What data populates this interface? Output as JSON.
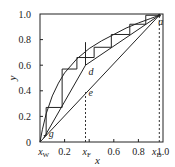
{
  "chart_data": {
    "type": "line",
    "title": "",
    "xlabel": "x",
    "ylabel": "y",
    "xlim": [
      0,
      1.0
    ],
    "ylim": [
      0,
      1.0
    ],
    "grid": false,
    "x_tick_labels": [
      {
        "value": 0.03,
        "label": "x",
        "sub": "W"
      },
      {
        "value": 0.2,
        "label": "0.2"
      },
      {
        "value": 0.38,
        "label": "x",
        "sub": "F"
      },
      {
        "value": 0.6,
        "label": "0.6"
      },
      {
        "value": 0.8,
        "label": "0.8"
      },
      {
        "value": 0.95,
        "label": "x",
        "sub": "D"
      },
      {
        "value": 1.0,
        "label": "1.0"
      }
    ],
    "y_tick_labels": [
      {
        "value": 0,
        "label": "0"
      },
      {
        "value": 0.2,
        "label": "0.2"
      },
      {
        "value": 0.4,
        "label": "0.4"
      },
      {
        "value": 0.6,
        "label": "0.6"
      },
      {
        "value": 0.8,
        "label": "0.8"
      },
      {
        "value": 1.0,
        "label": "1.0"
      }
    ],
    "x_ticks_minor": [
      0.2,
      0.4,
      0.6,
      0.8
    ],
    "y_ticks_minor": [
      0.2,
      0.4,
      0.6,
      0.8
    ],
    "series": [
      {
        "name": "equilibrium curve",
        "points": [
          [
            0,
            0
          ],
          [
            0.02,
            0.1
          ],
          [
            0.05,
            0.22
          ],
          [
            0.1,
            0.36
          ],
          [
            0.15,
            0.46
          ],
          [
            0.2,
            0.54
          ],
          [
            0.3,
            0.65
          ],
          [
            0.4,
            0.73
          ],
          [
            0.5,
            0.79
          ],
          [
            0.6,
            0.84
          ],
          [
            0.7,
            0.89
          ],
          [
            0.8,
            0.93
          ],
          [
            0.9,
            0.965
          ],
          [
            0.97,
            0.99
          ]
        ]
      },
      {
        "name": "diagonal",
        "points": [
          [
            0,
            0
          ],
          [
            0.97,
            0.99
          ]
        ]
      },
      {
        "name": "rectifying operating line",
        "points": [
          [
            0.97,
            0.99
          ],
          [
            0.37,
            0.6
          ]
        ]
      },
      {
        "name": "stripping operating line",
        "points": [
          [
            0.03,
            0.03
          ],
          [
            0.37,
            0.6
          ]
        ]
      },
      {
        "name": "q-line",
        "points": [
          [
            0.37,
            0.6
          ],
          [
            0.37,
            0.78
          ]
        ]
      },
      {
        "name": "steps",
        "points": [
          [
            0.97,
            0.99
          ],
          [
            0.86,
            0.99
          ],
          [
            0.86,
            0.92
          ],
          [
            0.73,
            0.92
          ],
          [
            0.73,
            0.84
          ],
          [
            0.58,
            0.84
          ],
          [
            0.58,
            0.74
          ],
          [
            0.44,
            0.74
          ],
          [
            0.44,
            0.66
          ],
          [
            0.3,
            0.66
          ],
          [
            0.3,
            0.57
          ],
          [
            0.18,
            0.57
          ],
          [
            0.18,
            0.27
          ],
          [
            0.05,
            0.27
          ],
          [
            0.05,
            0.05
          ],
          [
            0.03,
            0.05
          ]
        ]
      }
    ],
    "dashed_lines": [
      {
        "name": "xF-guide",
        "x": 0.37,
        "y_from": 0,
        "y_to": 0.39
      },
      {
        "name": "xD-guide",
        "x": 0.97,
        "y_from": 0,
        "y_to": 0.99
      }
    ],
    "annotations": [
      {
        "label": "a",
        "x": 0.97,
        "y": 0.99
      },
      {
        "label": "d",
        "x": 0.37,
        "y": 0.6
      },
      {
        "label": "e",
        "x": 0.37,
        "y": 0.39
      },
      {
        "label": "g",
        "x": 0.03,
        "y": 0.03
      }
    ]
  }
}
